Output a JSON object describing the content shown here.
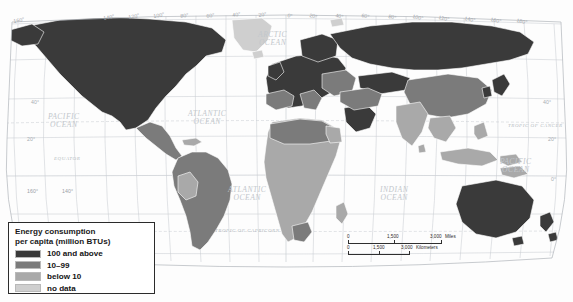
{
  "map": {
    "title": "World map of energy consumption per capita",
    "projection": "robinson",
    "background_color": "#fdfdfd",
    "graticule_color": "#c9ced3"
  },
  "legend": {
    "title_line1": "Energy consumption",
    "title_line2": "per capita (million BTUs)",
    "entries": [
      {
        "label": "100 and above",
        "color": "#3a3a3a"
      },
      {
        "label": "10–99",
        "color": "#7b7b7b"
      },
      {
        "label": "below 10",
        "color": "#a9a9a9"
      },
      {
        "label": "no data",
        "color": "#cfcfcf"
      }
    ]
  },
  "scalebar": {
    "miles": {
      "start": "0",
      "mid": "1,500",
      "end": "3,000",
      "unit": "Miles"
    },
    "kilometers": {
      "start": "0",
      "mid": "1,500",
      "end": "3,000",
      "unit": "Kilometers"
    }
  },
  "ocean_labels": [
    {
      "name": "arctic-ocean",
      "line1": "ARCTIC",
      "line2": "OCEAN",
      "x": 258,
      "y": 31
    },
    {
      "name": "pacific-ocean-west",
      "line1": "PACIFIC",
      "line2": "OCEAN",
      "x": 48,
      "y": 113
    },
    {
      "name": "atlantic-ocean-north",
      "line1": "ATLANTIC",
      "line2": "OCEAN",
      "x": 188,
      "y": 110
    },
    {
      "name": "pacific-ocean-east",
      "line1": "PACIFIC",
      "line2": "OCEAN",
      "x": 500,
      "y": 158
    },
    {
      "name": "atlantic-ocean-south",
      "line1": "ATLANTIC",
      "line2": "OCEAN",
      "x": 228,
      "y": 186
    },
    {
      "name": "indian-ocean",
      "line1": "INDIAN",
      "line2": "OCEAN",
      "x": 380,
      "y": 186
    }
  ],
  "reference_lines": [
    {
      "name": "tropic-of-cancer",
      "label": "TROPIC OF CANCER",
      "x": 508,
      "y": 123
    },
    {
      "name": "equator",
      "label": "EQUATOR",
      "x": 54,
      "y": 156
    },
    {
      "name": "tropic-of-capricorn",
      "label": "TROPIC OF CAPRICORN",
      "x": 215,
      "y": 228
    }
  ],
  "longitude_labels_top": [
    {
      "v": "160°",
      "x": 14
    },
    {
      "v": "140°",
      "x": 104
    },
    {
      "v": "120°",
      "x": 129
    },
    {
      "v": "100°",
      "x": 154
    },
    {
      "v": "80°",
      "x": 181
    },
    {
      "v": "60°",
      "x": 207
    },
    {
      "v": "40°",
      "x": 233
    },
    {
      "v": "20°",
      "x": 259
    },
    {
      "v": "0°",
      "x": 287
    },
    {
      "v": "20°",
      "x": 309
    },
    {
      "v": "40°",
      "x": 335
    },
    {
      "v": "60°",
      "x": 361
    },
    {
      "v": "80°",
      "x": 388
    },
    {
      "v": "100°",
      "x": 412
    },
    {
      "v": "120°",
      "x": 438
    },
    {
      "v": "140°",
      "x": 464
    },
    {
      "v": "160°",
      "x": 490
    },
    {
      "v": "180°",
      "x": 516
    }
  ],
  "longitude_labels_bottom": [
    {
      "v": "160°",
      "x": 27
    },
    {
      "v": "140°",
      "x": 62
    }
  ],
  "latitude_labels_left": [
    {
      "v": "40°",
      "x": 31,
      "y": 99
    },
    {
      "v": "20°",
      "x": 27,
      "y": 136
    }
  ],
  "latitude_labels_right": [
    {
      "v": "40°",
      "x": 543,
      "y": 99
    },
    {
      "v": "20°",
      "x": 548,
      "y": 136
    },
    {
      "v": "0°",
      "x": 551,
      "y": 176
    }
  ],
  "chart_data": {
    "type": "map",
    "title": "Energy consumption per capita (million BTUs)",
    "categories": [
      "100 and above",
      "10–99",
      "below 10",
      "no data"
    ],
    "colors": [
      "#3a3a3a",
      "#7b7b7b",
      "#a9a9a9",
      "#cfcfcf"
    ],
    "regions": [
      {
        "name": "Canada",
        "class": "100 and above"
      },
      {
        "name": "United States",
        "class": "100 and above"
      },
      {
        "name": "Greenland",
        "class": "no data"
      },
      {
        "name": "Mexico",
        "class": "10–99"
      },
      {
        "name": "Brazil",
        "class": "10–99"
      },
      {
        "name": "Argentina",
        "class": "10–99"
      },
      {
        "name": "Chile",
        "class": "10–99"
      },
      {
        "name": "Peru",
        "class": "below 10"
      },
      {
        "name": "Bolivia",
        "class": "below 10"
      },
      {
        "name": "Colombia",
        "class": "10–99"
      },
      {
        "name": "Venezuela",
        "class": "10–99"
      },
      {
        "name": "Norway",
        "class": "100 and above"
      },
      {
        "name": "Sweden",
        "class": "100 and above"
      },
      {
        "name": "Finland",
        "class": "100 and above"
      },
      {
        "name": "Russia",
        "class": "100 and above"
      },
      {
        "name": "United Kingdom",
        "class": "100 and above"
      },
      {
        "name": "France",
        "class": "100 and above"
      },
      {
        "name": "Germany",
        "class": "100 and above"
      },
      {
        "name": "Spain",
        "class": "10–99"
      },
      {
        "name": "Italy",
        "class": "10–99"
      },
      {
        "name": "Poland",
        "class": "10–99"
      },
      {
        "name": "Ukraine",
        "class": "10–99"
      },
      {
        "name": "Kazakhstan",
        "class": "100 and above"
      },
      {
        "name": "China",
        "class": "10–99"
      },
      {
        "name": "India",
        "class": "below 10"
      },
      {
        "name": "Japan",
        "class": "100 and above"
      },
      {
        "name": "South Korea",
        "class": "100 and above"
      },
      {
        "name": "Saudi Arabia",
        "class": "100 and above"
      },
      {
        "name": "Iran",
        "class": "10–99"
      },
      {
        "name": "Egypt",
        "class": "below 10"
      },
      {
        "name": "Algeria",
        "class": "10–99"
      },
      {
        "name": "Libya",
        "class": "10–99"
      },
      {
        "name": "Nigeria",
        "class": "below 10"
      },
      {
        "name": "Democratic Republic of the Congo",
        "class": "below 10"
      },
      {
        "name": "Ethiopia",
        "class": "below 10"
      },
      {
        "name": "Kenya",
        "class": "below 10"
      },
      {
        "name": "South Africa",
        "class": "10–99"
      },
      {
        "name": "Australia",
        "class": "100 and above"
      },
      {
        "name": "New Zealand",
        "class": "100 and above"
      },
      {
        "name": "Indonesia",
        "class": "below 10"
      }
    ]
  }
}
